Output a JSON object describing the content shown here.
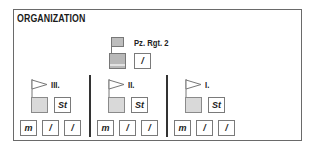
{
  "title": "ORGANIZATION",
  "regiment": {
    "label": "Pz. Rgt. 2",
    "hq_icon": "regiment-flag-icon",
    "staff_label": "/"
  },
  "battalions": [
    {
      "label": "III.",
      "flag_icon": "battalion-pennant-icon",
      "staff_label": "St",
      "companies": [
        "m",
        "/",
        "/"
      ]
    },
    {
      "label": "II.",
      "flag_icon": "battalion-pennant-icon",
      "staff_label": "St",
      "companies": [
        "m",
        "/",
        "/"
      ]
    },
    {
      "label": "I.",
      "flag_icon": "battalion-pennant-icon",
      "staff_label": "St",
      "companies": [
        "m",
        "/",
        "/"
      ]
    }
  ],
  "colors": {
    "border": "#6a6a6a",
    "hq_fill": "#b8b8b8",
    "unit_fill": "#d9d9d9",
    "divider": "#333333"
  }
}
